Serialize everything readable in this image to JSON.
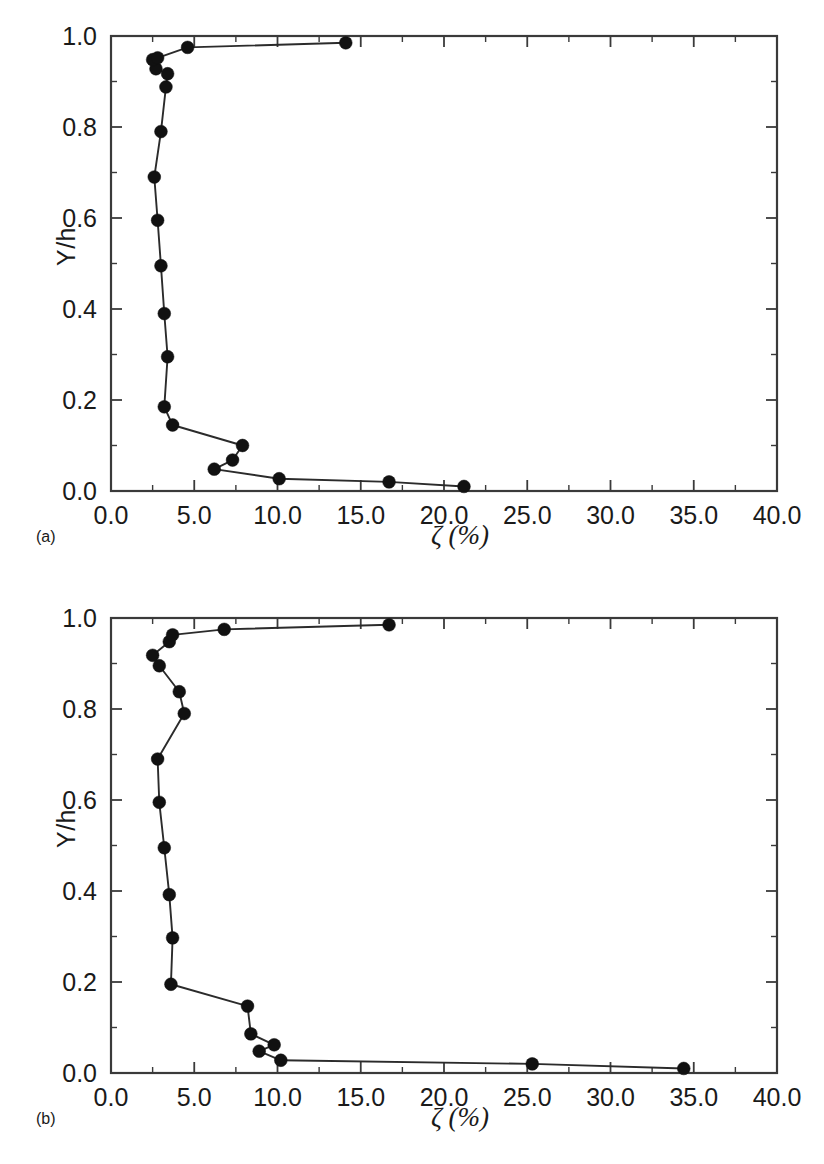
{
  "figure": {
    "background": "#ffffff",
    "line_color": "#2b2b2b",
    "marker_color": "#111111",
    "axis_color": "#3a3a3a"
  },
  "panels": [
    {
      "tag": "(a)",
      "ylabel": "Y/h",
      "xlabel": "ζ (%)"
    },
    {
      "tag": "(b)",
      "ylabel": "Y/h",
      "xlabel": "ζ (%)"
    }
  ],
  "axis": {
    "x_ticks": [
      "0.0",
      "5.0",
      "10.0",
      "15.0",
      "20.0",
      "25.0",
      "30.0",
      "35.0",
      "40.0"
    ],
    "y_ticks": [
      "0.0",
      "0.2",
      "0.4",
      "0.6",
      "0.8",
      "1.0"
    ]
  },
  "chart_data": [
    {
      "type": "line",
      "title": "(a)",
      "xlabel": "ζ (%)",
      "ylabel": "Y/h",
      "xlim": [
        0.0,
        40.0
      ],
      "ylim": [
        0.0,
        1.0
      ],
      "xticks": [
        0.0,
        5.0,
        10.0,
        15.0,
        20.0,
        25.0,
        30.0,
        35.0,
        40.0
      ],
      "yticks": [
        0.0,
        0.2,
        0.4,
        0.6,
        0.8,
        1.0
      ],
      "x_minor_tick_interval": 2.5,
      "y_minor_tick_interval": 0.1,
      "grid": false,
      "legend": false,
      "marker": "filled-circle",
      "series": [
        {
          "name": "damping ratio profile (a)",
          "x": [
            21.2,
            16.7,
            10.1,
            6.2,
            7.3,
            7.9,
            3.7,
            3.2,
            3.4,
            3.2,
            3.0,
            2.8,
            2.6,
            3.0,
            3.3,
            3.4,
            2.7,
            2.5,
            2.8,
            4.6,
            14.1
          ],
          "y": [
            0.01,
            0.02,
            0.027,
            0.048,
            0.068,
            0.1,
            0.145,
            0.185,
            0.295,
            0.39,
            0.495,
            0.595,
            0.69,
            0.79,
            0.888,
            0.917,
            0.928,
            0.948,
            0.952,
            0.975,
            0.985
          ]
        }
      ]
    },
    {
      "type": "line",
      "title": "(b)",
      "xlabel": "ζ (%)",
      "ylabel": "Y/h",
      "xlim": [
        0.0,
        40.0
      ],
      "ylim": [
        0.0,
        1.0
      ],
      "xticks": [
        0.0,
        5.0,
        10.0,
        15.0,
        20.0,
        25.0,
        30.0,
        35.0,
        40.0
      ],
      "yticks": [
        0.0,
        0.2,
        0.4,
        0.6,
        0.8,
        1.0
      ],
      "x_minor_tick_interval": 2.5,
      "y_minor_tick_interval": 0.1,
      "grid": false,
      "legend": false,
      "marker": "filled-circle",
      "series": [
        {
          "name": "damping ratio profile (b)",
          "x": [
            34.4,
            25.3,
            10.2,
            8.9,
            9.8,
            8.4,
            8.2,
            3.6,
            3.7,
            3.5,
            3.2,
            2.9,
            2.8,
            4.4,
            4.1,
            2.9,
            2.5,
            3.5,
            3.7,
            6.8,
            16.7
          ],
          "y": [
            0.01,
            0.02,
            0.028,
            0.048,
            0.062,
            0.086,
            0.147,
            0.195,
            0.297,
            0.392,
            0.495,
            0.595,
            0.69,
            0.79,
            0.838,
            0.895,
            0.918,
            0.948,
            0.963,
            0.975,
            0.985
          ]
        }
      ]
    }
  ]
}
